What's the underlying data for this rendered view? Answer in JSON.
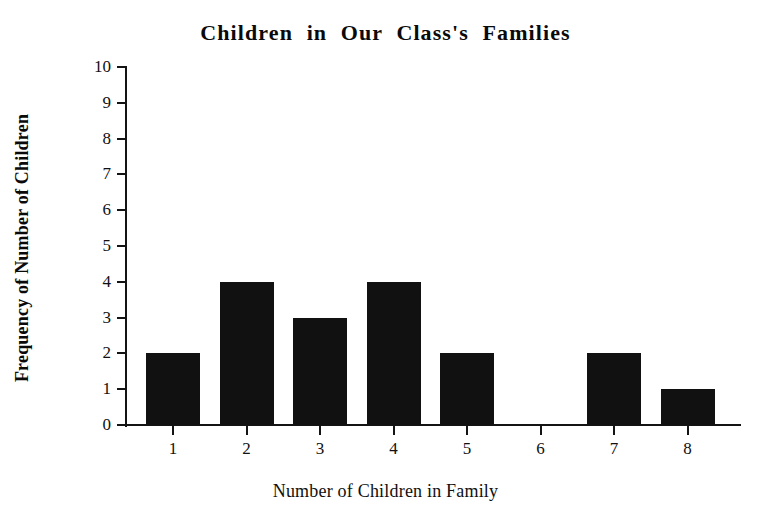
{
  "chart_data": {
    "type": "bar",
    "title": "Children in Our Class's Families",
    "xlabel": "Number of Children in Family",
    "ylabel": "Frequency of Number of Children",
    "categories": [
      "1",
      "2",
      "3",
      "4",
      "5",
      "6",
      "7",
      "8"
    ],
    "values": [
      2,
      4,
      3,
      4,
      2,
      0,
      2,
      1
    ],
    "ylim": [
      0,
      10
    ],
    "y_ticks": [
      "10",
      "9",
      "8",
      "7",
      "6",
      "5",
      "4",
      "3",
      "2",
      "1",
      "0"
    ],
    "grid": false,
    "legend": null,
    "bar_color": "#111111",
    "axis_color": "#141414",
    "background_color": "#ffffff"
  }
}
